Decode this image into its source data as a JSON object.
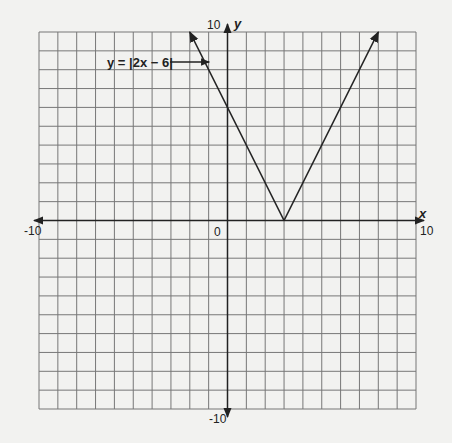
{
  "chart_data": {
    "type": "line",
    "title": "",
    "xlabel": "x",
    "ylabel": "y",
    "xlim": [
      -10,
      10
    ],
    "ylim": [
      -10,
      10
    ],
    "grid": true,
    "grid_step": 1,
    "tick_labels": {
      "x_min": "-10",
      "x_max": "10",
      "y_min": "-10",
      "y_max": "10",
      "origin": "0"
    },
    "series": [
      {
        "name": "y = |2x − 6|",
        "equation": "y = |2x - 6|",
        "points": [
          [
            -2,
            10
          ],
          [
            3,
            0
          ],
          [
            8,
            10
          ]
        ],
        "arrows_at_ends": true
      }
    ],
    "annotations": [
      {
        "text": "y = |2x − 6|",
        "points_to": [
          -1.5,
          9
        ],
        "arrow": true
      }
    ]
  },
  "labels": {
    "x_axis": "x",
    "y_axis": "y",
    "x_min": "-10",
    "x_max": "10",
    "y_max": "10",
    "y_min": "-10",
    "origin": "0",
    "equation": "y = |2x − 6|"
  }
}
